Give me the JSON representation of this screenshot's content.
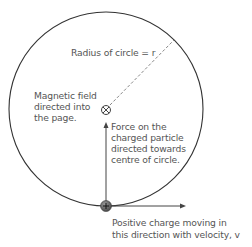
{
  "diagram": {
    "colors": {
      "line": "#333333",
      "text": "#555555",
      "dashed": "#888888",
      "charge_fill": "#666666"
    },
    "labels": {
      "radius": "Radius of circle = r",
      "field_line1": "Magnetic field",
      "field_line2": "directed into",
      "field_line3": "the page.",
      "force_line1": "Force on the",
      "force_line2": "charged particle",
      "force_line3": "directed towards",
      "force_line4": "centre of circle.",
      "velocity_line1": "Positive charge moving in",
      "velocity_line2": "this direction with velocity, v"
    },
    "symbols": {
      "field_into_page": "cross-in-circle",
      "charge": "+"
    }
  }
}
